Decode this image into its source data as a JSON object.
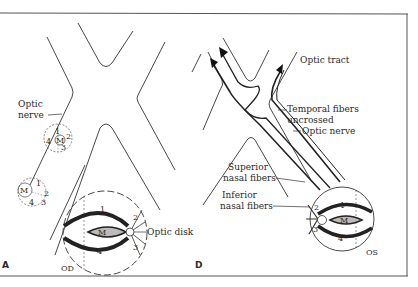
{
  "figure": {
    "panels": [
      {
        "id": "A",
        "label": "A",
        "eye_label": "OD",
        "labels": {
          "optic_nerve": [
            "Optic",
            "nerve"
          ],
          "optic_disk": "Optic disk"
        },
        "quadrants": {
          "q1": "1",
          "q2": "2",
          "q3": "3",
          "q4": "4",
          "macula": "M"
        }
      },
      {
        "id": "B",
        "label": "D",
        "eye_label": "OS",
        "labels": {
          "optic_tract": "Optic tract",
          "temporal_fibers": [
            "Temporal fibers",
            "uncrossed"
          ],
          "optic_nerve": "Optic nerve",
          "superior_nasal": [
            "Superior",
            "nasal fibers"
          ],
          "inferior_nasal": [
            "Inferior",
            "nasal fibers"
          ]
        },
        "quadrants": {
          "q1": "1",
          "q2": "2",
          "q3": "3",
          "q4": "4",
          "macula": "M"
        }
      }
    ],
    "caption": "Fig. 7.3. The chiasm..."
  },
  "colors": {
    "line": "#333333",
    "frame": "#555555",
    "background": "#ffffff"
  }
}
